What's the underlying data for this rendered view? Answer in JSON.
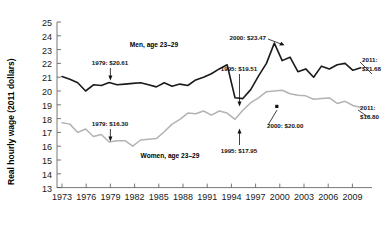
{
  "chart_data": {
    "type": "line",
    "title": "",
    "xlabel": "",
    "ylabel": "Real hourly wage (2011 dollars)",
    "xlim": [
      1973,
      2011
    ],
    "ylim": [
      13,
      25
    ],
    "ytick_labels": [
      "13",
      "14",
      "15",
      "16",
      "17",
      "18",
      "19",
      "20",
      "21",
      "22",
      "23",
      "24",
      "25"
    ],
    "xtick_labels": [
      "1973",
      "1976",
      "1979",
      "1982",
      "1985",
      "1988",
      "1991",
      "1994",
      "1997",
      "2000",
      "2003",
      "2006",
      "2009"
    ],
    "grid": false,
    "legend_position": "inline-labels",
    "x": [
      1973,
      1974,
      1975,
      1976,
      1977,
      1978,
      1979,
      1980,
      1981,
      1982,
      1983,
      1984,
      1985,
      1986,
      1987,
      1988,
      1989,
      1990,
      1991,
      1992,
      1993,
      1994,
      1995,
      1996,
      1997,
      1998,
      1999,
      2000,
      2001,
      2002,
      2003,
      2004,
      2005,
      2006,
      2007,
      2008,
      2009,
      2010,
      2011
    ],
    "series": [
      {
        "name": "Men, age 23–29",
        "color": "#1a1a1a",
        "values": [
          21.05,
          20.85,
          20.6,
          20.0,
          20.45,
          20.4,
          20.61,
          20.45,
          20.5,
          20.55,
          20.6,
          20.45,
          20.3,
          20.6,
          20.35,
          20.5,
          20.4,
          20.8,
          21.0,
          21.25,
          21.6,
          21.9,
          19.51,
          19.45,
          20.1,
          21.1,
          22.0,
          23.47,
          22.2,
          22.45,
          21.4,
          21.6,
          21.0,
          21.8,
          21.6,
          21.9,
          22.0,
          21.5,
          21.68
        ]
      },
      {
        "name": "Women, age 23–29",
        "color": "#b3b3b3",
        "values": [
          17.7,
          17.6,
          17.0,
          17.25,
          16.7,
          16.85,
          16.3,
          16.4,
          16.4,
          16.0,
          16.45,
          16.5,
          16.55,
          17.05,
          17.6,
          17.95,
          18.4,
          18.35,
          18.55,
          18.25,
          18.55,
          18.4,
          17.95,
          18.6,
          19.15,
          19.5,
          19.95,
          20.0,
          20.05,
          19.8,
          19.7,
          19.65,
          19.4,
          19.45,
          19.5,
          19.1,
          19.25,
          18.95,
          18.8
        ]
      }
    ],
    "annotations": [
      {
        "id": "men-1979",
        "text": "1979: $20.61",
        "point_x": 1979,
        "point_y": 20.61
      },
      {
        "id": "men-1995",
        "text": "1995: $19.51",
        "point_x": 1995,
        "point_y": 19.51
      },
      {
        "id": "men-2000",
        "text": "2000: $23.47",
        "point_x": 2000,
        "point_y": 23.47
      },
      {
        "id": "men-2011",
        "text": "2011:",
        "text2": "$21.68",
        "point_x": 2011,
        "point_y": 21.68
      },
      {
        "id": "women-1979",
        "text": "1979: $16.30",
        "point_x": 1979,
        "point_y": 16.3
      },
      {
        "id": "women-1995",
        "text": "1995: $17.95",
        "point_x": 1995,
        "point_y": 17.95
      },
      {
        "id": "women-2000",
        "text": "2000: $20.00",
        "point_x": 2000,
        "point_y": 20.0
      },
      {
        "id": "women-2011",
        "text": "2011:",
        "text2": "$18.80",
        "point_x": 2011,
        "point_y": 18.8
      }
    ]
  },
  "axis": {
    "y_label": "Real hourly wage (2011 dollars)",
    "y_ticks": [
      "25",
      "24",
      "23",
      "22",
      "21",
      "20",
      "19",
      "18",
      "17",
      "16",
      "15",
      "14",
      "13"
    ],
    "x_ticks": [
      "1973",
      "1976",
      "1979",
      "1982",
      "1985",
      "1988",
      "1991",
      "1994",
      "1997",
      "2000",
      "2003",
      "2006",
      "2009"
    ]
  },
  "labels": {
    "men_series": "Men, age 23–29",
    "women_series": "Women, age 23–29",
    "men_1979": "1979: $20.61",
    "men_1995": "1995: $19.51",
    "men_2000": "2000: $23.47",
    "men_2011_year": "2011:",
    "men_2011_value": "$21.68",
    "women_1979": "1979: $16.30",
    "women_1995": "1995: $17.95",
    "women_2000": "2000: $20.00",
    "women_2011_year": "2011:",
    "women_2011_value": "$18.80"
  },
  "colors": {
    "men_line": "#1a1a1a",
    "women_line": "#b3b3b3",
    "axis": "#555555",
    "text": "#000000"
  }
}
